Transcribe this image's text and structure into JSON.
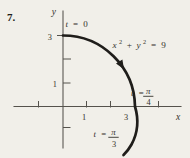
{
  "colors": {
    "background": "#f1efe9",
    "ink": "#1f1d1a",
    "axis": "#55524c",
    "text": "#35322c"
  },
  "problem_number": "7.",
  "axes": {
    "x_label": "x",
    "y_label": "y"
  },
  "tick_labels": {
    "y_3": "3",
    "y_1": "1",
    "x_1": "1",
    "x_3": "3"
  },
  "curve_labels": {
    "equation": {
      "term1": "x",
      "exp1": "2",
      "plus": "+",
      "term2": "y",
      "exp2": "2",
      "equals": "=",
      "value": "9"
    },
    "start": {
      "var": "t",
      "equals": "=",
      "value": "0"
    },
    "crossing": {
      "var": "t",
      "equals": "=",
      "numerator": "π",
      "denominator": "4"
    },
    "end": {
      "var": "t",
      "equals": "=",
      "numerator": "π",
      "denominator": "3"
    }
  },
  "figure_description": {
    "type": "parametric_circular_arc",
    "equation_shown": "x² + y² = 9",
    "radius": 3,
    "direction": "clockwise",
    "labeled_points": [
      {
        "t": "0",
        "point": [
          0,
          3
        ]
      },
      {
        "t": "π/4",
        "point": [
          3,
          0
        ]
      },
      {
        "t": "π/3",
        "point_region": "below x-axis"
      }
    ],
    "x_ticks": [
      -1,
      1,
      2,
      4
    ],
    "y_ticks": [
      -1,
      1,
      2,
      3
    ]
  }
}
